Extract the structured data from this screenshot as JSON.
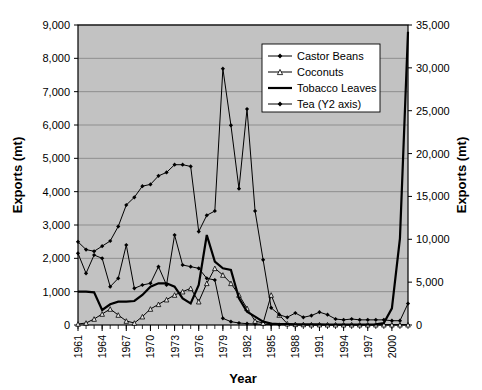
{
  "chart_data": {
    "type": "line",
    "title": "",
    "xlabel": "Year",
    "ylabel": "Exports (mt)",
    "y2label": "Exports (mt)",
    "ylim": [
      0,
      9000
    ],
    "y2lim": [
      0,
      35000
    ],
    "ytick_labels": [
      "0",
      "1,000",
      "2,000",
      "3,000",
      "4,000",
      "5,000",
      "6,000",
      "7,000",
      "8,000",
      "9,000"
    ],
    "ytick_values": [
      0,
      1000,
      2000,
      3000,
      4000,
      5000,
      6000,
      7000,
      8000,
      9000
    ],
    "y2tick_labels": [
      "0",
      "5,000",
      "10,000",
      "15,000",
      "20,000",
      "25,000",
      "30,000",
      "35,000"
    ],
    "y2tick_values": [
      0,
      5000,
      10000,
      15000,
      20000,
      25000,
      30000,
      35000
    ],
    "grid": true,
    "legend_position": "top-right",
    "x": [
      1961,
      1962,
      1963,
      1964,
      1965,
      1966,
      1967,
      1968,
      1969,
      1970,
      1971,
      1972,
      1973,
      1974,
      1975,
      1976,
      1977,
      1978,
      1979,
      1980,
      1981,
      1982,
      1983,
      1984,
      1985,
      1986,
      1987,
      1988,
      1989,
      1990,
      1991,
      1992,
      1993,
      1994,
      1995,
      1996,
      1997,
      1998,
      1999,
      2000,
      2001,
      2002
    ],
    "xtick_labels": [
      "1961",
      "1964",
      "1967",
      "1970",
      "1973",
      "1976",
      "1979",
      "1982",
      "1985",
      "1988",
      "1991",
      "1994",
      "1997",
      "2000"
    ],
    "xtick_values": [
      1961,
      1964,
      1967,
      1970,
      1973,
      1976,
      1979,
      1982,
      1985,
      1988,
      1991,
      1994,
      1997,
      2000
    ],
    "series": [
      {
        "name": "Castor Beans",
        "axis": "y1",
        "marker": "filled-diamond",
        "values": [
          2150,
          1550,
          2100,
          2000,
          1150,
          1400,
          2400,
          1100,
          1200,
          1250,
          1750,
          1200,
          2700,
          1800,
          1750,
          1700,
          1400,
          1350,
          200,
          100,
          60,
          40,
          30,
          20,
          15,
          10,
          10,
          8,
          8,
          6,
          6,
          5,
          5,
          5,
          5,
          5,
          5,
          5,
          5,
          5,
          5,
          5
        ]
      },
      {
        "name": "Coconuts",
        "axis": "y1",
        "marker": "open-triangle",
        "values": [
          30,
          60,
          180,
          330,
          480,
          300,
          120,
          60,
          250,
          480,
          620,
          760,
          900,
          1000,
          1100,
          700,
          1250,
          1700,
          1500,
          1250,
          900,
          500,
          120,
          60,
          900,
          300,
          40,
          20,
          15,
          10,
          10,
          8,
          8,
          8,
          8,
          8,
          8,
          8,
          8,
          8,
          8,
          8
        ]
      },
      {
        "name": "Tobacco Leaves",
        "axis": "y1",
        "marker": "none",
        "values": [
          1000,
          1000,
          980,
          450,
          620,
          700,
          700,
          720,
          900,
          1150,
          1250,
          1250,
          1150,
          800,
          650,
          1200,
          2700,
          1900,
          1700,
          1650,
          800,
          400,
          250,
          100,
          40,
          30,
          25,
          20,
          20,
          18,
          18,
          15,
          15,
          15,
          15,
          15,
          15,
          20,
          60,
          500,
          2600,
          8800
        ]
      },
      {
        "name": "Tea (Y2 axis)",
        "axis": "y2",
        "marker": "filled-diamond",
        "values": [
          9700,
          8800,
          8600,
          9200,
          9800,
          11500,
          14000,
          14900,
          16200,
          16400,
          17400,
          17800,
          18700,
          18700,
          18500,
          10900,
          12800,
          13300,
          29900,
          23300,
          15900,
          25200,
          13300,
          7600,
          2000,
          1200,
          900,
          1400,
          900,
          1100,
          1500,
          1200,
          700,
          600,
          700,
          600,
          600,
          600,
          600,
          500,
          500,
          2500
        ]
      }
    ]
  }
}
